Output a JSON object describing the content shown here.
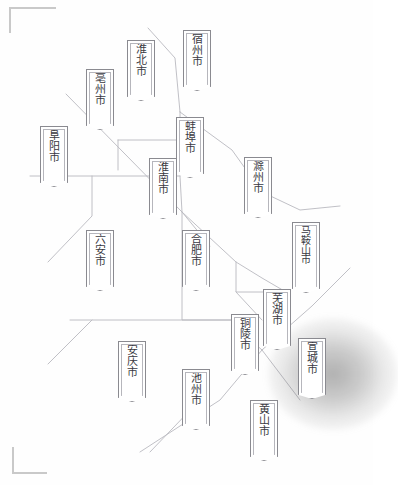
{
  "map": {
    "title": "安徽省地级市分布示意图",
    "region": "安徽省",
    "highlight_city": "宣城市",
    "colors": {
      "background": "#fefefe",
      "boundary_line": "#b9b9bf",
      "pennant_border": "#8a8a90",
      "pennant_inner_border": "#b6b6bc",
      "pennant_fill": "#ffffff",
      "label_text": "#3a3a42",
      "corner_mark": "#c9c9c9",
      "highlight_glow": "#5a5a5a"
    },
    "corner_marks": [
      {
        "name": "top-left",
        "label": "⌐"
      },
      {
        "name": "bottom-left",
        "label": "L"
      }
    ],
    "cities": [
      {
        "id": "suzhou",
        "name": "宿州市",
        "chars": [
          "宿",
          "州",
          "市"
        ],
        "x": 197,
        "y": 30,
        "w": 28,
        "h": 52,
        "highlight": false
      },
      {
        "id": "huaibei",
        "name": "淮北市",
        "chars": [
          "淮",
          "北",
          "市"
        ],
        "x": 141,
        "y": 40,
        "w": 28,
        "h": 52,
        "highlight": false
      },
      {
        "id": "bozhou",
        "name": "亳州市",
        "chars": [
          "亳",
          "州",
          "市"
        ],
        "x": 100,
        "y": 69,
        "w": 28,
        "h": 52,
        "highlight": false
      },
      {
        "id": "fuyang",
        "name": "阜阳市",
        "chars": [
          "阜",
          "阳",
          "市"
        ],
        "x": 54,
        "y": 126,
        "w": 28,
        "h": 52,
        "highlight": false
      },
      {
        "id": "bengbu",
        "name": "蚌埠市",
        "chars": [
          "蚌",
          "埠",
          "市"
        ],
        "x": 190,
        "y": 117,
        "w": 28,
        "h": 52,
        "highlight": false
      },
      {
        "id": "huainan",
        "name": "淮南市",
        "chars": [
          "淮",
          "南",
          "市"
        ],
        "x": 163,
        "y": 158,
        "w": 28,
        "h": 52,
        "highlight": false
      },
      {
        "id": "chuzhou",
        "name": "滁州市",
        "chars": [
          "滁",
          "州",
          "市"
        ],
        "x": 258,
        "y": 157,
        "w": 28,
        "h": 52,
        "highlight": false
      },
      {
        "id": "luan",
        "name": "六安市",
        "chars": [
          "六",
          "安",
          "市"
        ],
        "x": 100,
        "y": 230,
        "w": 28,
        "h": 52,
        "highlight": false
      },
      {
        "id": "hefei",
        "name": "合肥市",
        "chars": [
          "合",
          "肥",
          "市"
        ],
        "x": 196,
        "y": 230,
        "w": 28,
        "h": 52,
        "highlight": false
      },
      {
        "id": "maanshan",
        "name": "马鞍山市",
        "chars": [
          "马",
          "鞍",
          "山",
          "市"
        ],
        "x": 306,
        "y": 222,
        "w": 28,
        "h": 62,
        "highlight": false
      },
      {
        "id": "wuhu",
        "name": "芜湖市",
        "chars": [
          "芜",
          "湖",
          "市"
        ],
        "x": 277,
        "y": 289,
        "w": 28,
        "h": 52,
        "highlight": false
      },
      {
        "id": "tongling",
        "name": "铜陵市",
        "chars": [
          "铜",
          "陵",
          "市"
        ],
        "x": 245,
        "y": 314,
        "w": 28,
        "h": 52,
        "highlight": false
      },
      {
        "id": "xuancheng",
        "name": "宣城市",
        "chars": [
          "宣",
          "城",
          "市"
        ],
        "x": 312,
        "y": 338,
        "w": 28,
        "h": 52,
        "highlight": true
      },
      {
        "id": "anqing",
        "name": "安庆市",
        "chars": [
          "安",
          "庆",
          "市"
        ],
        "x": 132,
        "y": 341,
        "w": 28,
        "h": 52,
        "highlight": false
      },
      {
        "id": "chizhou",
        "name": "池州市",
        "chars": [
          "池",
          "州",
          "市"
        ],
        "x": 196,
        "y": 369,
        "w": 28,
        "h": 52,
        "highlight": false
      },
      {
        "id": "huangshan",
        "name": "黄山市",
        "chars": [
          "黄",
          "山",
          "市"
        ],
        "x": 264,
        "y": 400,
        "w": 28,
        "h": 52,
        "highlight": false
      }
    ],
    "boundary_paths": [
      "M148 28 L175 58 L180 112",
      "M66 94 L182 212 L210 246",
      "M118 140 L180 140 L180 112",
      "M118 140 L118 170",
      "M30 176 L180 176",
      "M180 176 L182 212",
      "M92 176 L92 216 L48 262",
      "M182 212 L182 320 L232 320",
      "M70 320 L232 320",
      "M182 212 L236 262 L262 278 L286 292",
      "M180 112 L232 150 L262 192",
      "M262 192 L300 210 L340 206",
      "M236 262 L236 292 L286 292",
      "M236 292 L262 320",
      "M232 320 L246 336 L262 350",
      "M262 350 L312 306 L350 268",
      "M262 350 L300 400",
      "M262 350 L220 400 L140 452",
      "M92 320 L48 364",
      "M196 404 L150 452"
    ]
  }
}
